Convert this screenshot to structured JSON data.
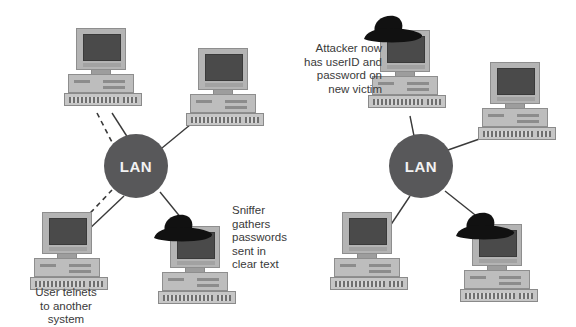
{
  "figure": {
    "background_color": "#ffffff",
    "width": 576,
    "height": 327
  },
  "colors": {
    "lan_fill": "#58585a",
    "lan_text": "#f2f2f2",
    "link_line": "#3a3a3a",
    "caption_text": "#3a3a3a",
    "hat_fill": "#111111",
    "monitor_bezel": "#b4b4b4",
    "screen": "#4a4a4a",
    "case": "#bdbdbd"
  },
  "panels": [
    {
      "id": "before-attack",
      "lan": {
        "label": "LAN",
        "cx": 136,
        "cy": 166,
        "r": 32
      },
      "computers": [
        {
          "id": "top-left-host",
          "name": "computer-top-left",
          "x": 64,
          "y": 28,
          "has_hat": false
        },
        {
          "id": "top-right-host",
          "name": "computer-top-right",
          "x": 186,
          "y": 48,
          "has_hat": false
        },
        {
          "id": "bottom-left-host",
          "name": "computer-bottom-left",
          "x": 30,
          "y": 212,
          "has_hat": false
        },
        {
          "id": "bottom-right-host",
          "name": "computer-sniffer",
          "x": 158,
          "y": 226,
          "has_hat": true
        }
      ],
      "links": [
        {
          "from": "top-left-host",
          "style": "solid",
          "x1": 112,
          "y1": 113,
          "x2": 128,
          "y2": 138
        },
        {
          "from": "top-left-host",
          "style": "dashed",
          "x1": 97,
          "y1": 113,
          "x2": 116,
          "y2": 150
        },
        {
          "from": "top-right-host",
          "style": "solid",
          "x1": 196,
          "y1": 120,
          "x2": 162,
          "y2": 148
        },
        {
          "from": "bottom-left-host",
          "style": "solid",
          "x1": 86,
          "y1": 232,
          "x2": 124,
          "y2": 196
        },
        {
          "from": "bottom-left-host",
          "style": "dashed",
          "x1": 78,
          "y1": 224,
          "x2": 112,
          "y2": 190
        },
        {
          "from": "bottom-right-host",
          "style": "solid",
          "x1": 186,
          "y1": 224,
          "x2": 160,
          "y2": 192
        }
      ],
      "captions": [
        {
          "id": "sniffer-caption",
          "name": "caption-sniffer",
          "text": "Sniffer\ngathers\npasswords\nsent in\nclear text",
          "x": 232,
          "y": 204,
          "align": "left"
        },
        {
          "id": "user-telnet-caption",
          "name": "caption-user-telnets",
          "text": "User telnets\nto another\nsystem",
          "x": 22,
          "y": 286,
          "align": "center",
          "width": 88
        }
      ]
    },
    {
      "id": "after-attack",
      "lan": {
        "label": "LAN",
        "cx": 133,
        "cy": 166,
        "r": 32
      },
      "computers": [
        {
          "id": "top-left-victim",
          "name": "computer-attacker-victim",
          "x": 80,
          "y": 30,
          "has_hat": true
        },
        {
          "id": "top-right-host",
          "name": "computer-top-right",
          "x": 190,
          "y": 62,
          "has_hat": false
        },
        {
          "id": "bottom-left-host",
          "name": "computer-bottom-left",
          "x": 42,
          "y": 212,
          "has_hat": false
        },
        {
          "id": "bottom-right-host",
          "name": "computer-attacker",
          "x": 172,
          "y": 224,
          "has_hat": true
        }
      ],
      "links": [
        {
          "from": "top-left-victim",
          "style": "solid",
          "x1": 122,
          "y1": 116,
          "x2": 126,
          "y2": 136
        },
        {
          "from": "top-right-host",
          "style": "solid",
          "x1": 200,
          "y1": 136,
          "x2": 160,
          "y2": 150
        },
        {
          "from": "bottom-left-host",
          "style": "solid",
          "x1": 98,
          "y1": 232,
          "x2": 122,
          "y2": 196
        },
        {
          "from": "bottom-right-host",
          "style": "solid",
          "x1": 196,
          "y1": 222,
          "x2": 157,
          "y2": 191
        }
      ],
      "captions": [
        {
          "id": "attacker-caption",
          "name": "caption-attacker",
          "text": "Attacker now\nhas userID and\npassword on\nnew victim",
          "x": 16,
          "y": 42,
          "align": "right",
          "width": 78
        }
      ]
    }
  ]
}
